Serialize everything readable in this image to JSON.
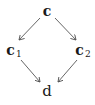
{
  "diagram": {
    "type": "commutative-diamond",
    "nodes": [
      {
        "id": "c",
        "label": "c",
        "subscript": "",
        "x": 47,
        "y": 11
      },
      {
        "id": "c1",
        "label": "c",
        "subscript": "1",
        "x": 13,
        "y": 51
      },
      {
        "id": "c2",
        "label": "c",
        "subscript": "2",
        "x": 82,
        "y": 51
      },
      {
        "id": "d",
        "label": "d",
        "subscript": "",
        "x": 47,
        "y": 91
      }
    ],
    "edges": [
      {
        "from": "c",
        "to": "c1"
      },
      {
        "from": "c",
        "to": "c2"
      },
      {
        "from": "c1",
        "to": "d"
      },
      {
        "from": "c2",
        "to": "d"
      }
    ],
    "colors": {
      "text": "#1a1a1a",
      "arrow": "#555555",
      "background": "#ffffff"
    }
  }
}
